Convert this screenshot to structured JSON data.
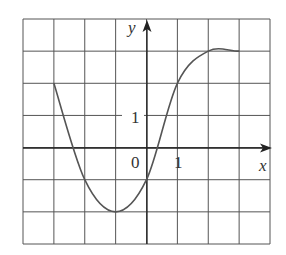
{
  "chart_data": {
    "type": "line",
    "title": "",
    "xlabel": "x",
    "ylabel": "y",
    "tick_labels": {
      "origin": "0",
      "x_tick": "1",
      "y_tick": "1"
    },
    "xlim": [
      -4,
      4
    ],
    "ylim": [
      -3,
      4
    ],
    "grid": true,
    "grid_step": 1,
    "x": [
      -3,
      -2,
      -1,
      0,
      1,
      2,
      3
    ],
    "values": [
      2,
      -1,
      -2,
      -1,
      2,
      3,
      3
    ]
  }
}
